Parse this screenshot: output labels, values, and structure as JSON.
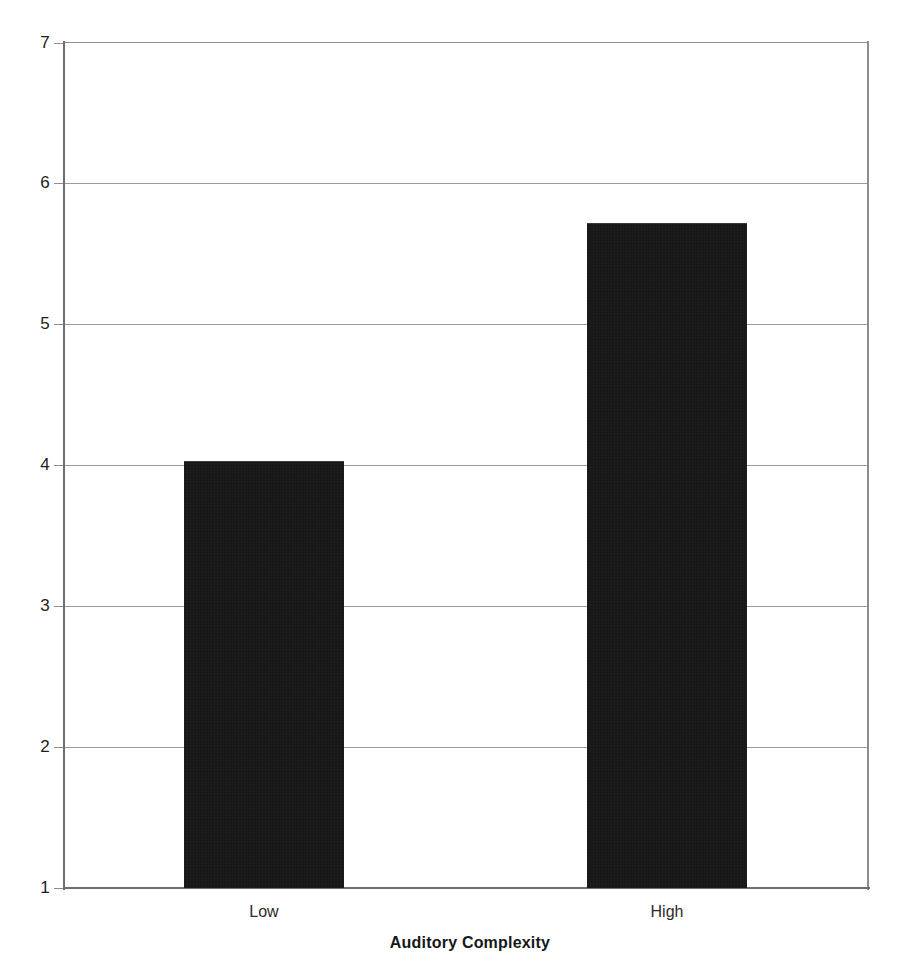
{
  "chart_data": {
    "type": "bar",
    "title": "",
    "subtitle": "",
    "xlabel": "Auditory Complexity",
    "ylabel": "",
    "categories": [
      "Low",
      "High"
    ],
    "values": [
      4.03,
      5.72
    ],
    "series": [
      {
        "name": "",
        "values": [
          4.03,
          5.72
        ]
      }
    ],
    "ylim": [
      1,
      7
    ],
    "yticks": [
      1,
      2,
      3,
      4,
      5,
      6,
      7
    ],
    "ytick_labels": [
      "1",
      "2",
      "3",
      "4",
      "5",
      "6",
      "7"
    ],
    "grid": true,
    "grid_axis": "y",
    "legend": false,
    "legend_position": "none",
    "bar_color": "#141414",
    "axis_color": "#6e6e70",
    "grid_color": "#9a9a9d",
    "background_color": "#ffffff",
    "annotations": []
  },
  "axes": {
    "y_tick_top": "7",
    "y_tick_bottom": "1"
  }
}
